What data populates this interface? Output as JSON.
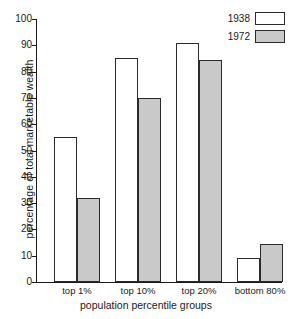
{
  "chart_data": {
    "type": "bar",
    "title": "",
    "xlabel": "population percentile groups",
    "ylabel": "percentage of total marketable wealth",
    "categories": [
      "top 1%",
      "top 10%",
      "top 20%",
      "bottom 80%"
    ],
    "series": [
      {
        "name": "1938",
        "values": [
          55,
          85,
          91,
          9
        ],
        "color": "#ffffff"
      },
      {
        "name": "1972",
        "values": [
          32,
          70,
          84.5,
          14.5
        ],
        "color": "#c9c9c9"
      }
    ],
    "ylim": [
      0,
      100
    ],
    "yticks": [
      0,
      10,
      20,
      30,
      40,
      50,
      60,
      70,
      80,
      90,
      100
    ],
    "ytick_labels": [
      "0",
      "10",
      "20",
      "30",
      "40",
      "50",
      "60",
      "70",
      "80",
      "90",
      "100"
    ],
    "grid": false,
    "legend_position": "top-right",
    "legend_entries": [
      {
        "label": "1938",
        "swatch": "white-box"
      },
      {
        "label": "1972",
        "swatch": "gray-box"
      }
    ]
  }
}
